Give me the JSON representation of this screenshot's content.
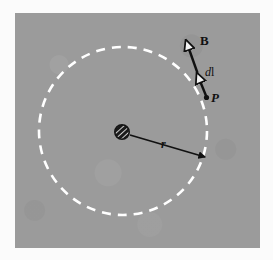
{
  "figure": {
    "background_color": "#ffffff",
    "panel_color": "#9b9b9b",
    "ink_color": "#111111",
    "loop_color": "#ffffff",
    "panel": {
      "x": 15,
      "y": 13,
      "width": 245,
      "height": 235
    },
    "loop": {
      "name": "amperian-loop",
      "shape": "dashed-circle",
      "center": {
        "x": 123,
        "y": 131
      },
      "radius": 84,
      "dash": "9 7",
      "stroke_width": 2.6
    },
    "wire": {
      "name": "current-carrying-wire",
      "symbol": "hatched-circle",
      "center": {
        "x": 122,
        "y": 132
      },
      "radius": 7
    },
    "radius_arrow": {
      "name": "radius-arrow",
      "from": {
        "x": 129,
        "y": 135
      },
      "to": {
        "x": 206,
        "y": 158
      }
    },
    "b_arrow": {
      "name": "b-field-arrow",
      "from": {
        "x": 197,
        "y": 73
      },
      "to": {
        "x": 185,
        "y": 39
      }
    },
    "dl_arrow": {
      "name": "dl-element-arrow",
      "from": {
        "x": 207,
        "y": 97
      },
      "to": {
        "x": 196,
        "y": 72
      }
    },
    "labels": {
      "b": "B",
      "dl_d": "d",
      "dl_l": "l",
      "p": "P",
      "r": "r"
    }
  }
}
